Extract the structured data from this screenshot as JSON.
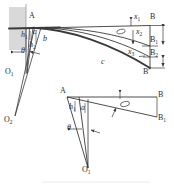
{
  "figure": {
    "kind": "engineering-geometry-diagram",
    "ink_color": "#3a3a3a",
    "hatch_fill_color": "#d8d8d8",
    "background_color": "#ffffff",
    "caption": ""
  },
  "upper_diagram": {
    "name": "upper-construction",
    "wall_label": "A",
    "pivot_labels": {
      "o1": "O",
      "o1_sub": "1",
      "o2": "O",
      "o2_sub": "2"
    },
    "height_labels": [
      {
        "base": "h",
        "sub": "1"
      },
      {
        "base": "h",
        "sub": "2"
      }
    ],
    "angle_label": "θ",
    "phi_label": "φ",
    "curve_labels": [
      "a",
      "b",
      "c"
    ],
    "displacement_labels": [
      {
        "base": "x",
        "sub": "1"
      },
      {
        "base": "x",
        "sub": "2"
      },
      {
        "base": "x",
        "sub": "3"
      }
    ],
    "right_points": [
      {
        "base": "B",
        "sub": ""
      },
      {
        "base": "B",
        "sub": "1"
      },
      {
        "base": "B",
        "sub": "2"
      },
      {
        "base": "B",
        "sub": "′"
      }
    ]
  },
  "lower_diagram": {
    "name": "lower-construction",
    "apex_label": "A",
    "pivot_label": "O",
    "pivot_sub": "1",
    "height_label": {
      "base": "h",
      "sub": "1"
    },
    "segment_label": "a",
    "angle_theta": "θ",
    "angle_phi": "φ",
    "right_points": [
      {
        "base": "B",
        "sub": ""
      },
      {
        "base": "B",
        "sub": "1"
      }
    ]
  }
}
